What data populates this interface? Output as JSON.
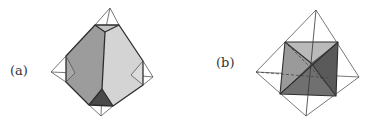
{
  "figure": {
    "panels": [
      {
        "label": "(a)",
        "description": "Truncated tetrahedron inscribed in a wireframe tetrahedron",
        "colors": {
          "left_face": "#9a9a9a",
          "right_face": "#d2d2d2",
          "top_face": "#c8c8c8",
          "bottom_face": "#4a4a4a",
          "edge": "#333333",
          "wire": "#555555"
        }
      },
      {
        "label": "(b)",
        "description": "Octahedron-like shaded solid inside a wireframe tetrahedron",
        "colors": {
          "left_face": "#9a9a9a",
          "top_face": "#b8b8b8",
          "right_face": "#5e5e5e",
          "bottom_face": "#6e6e6e",
          "edge": "#333333",
          "wire": "#555555"
        }
      }
    ]
  }
}
